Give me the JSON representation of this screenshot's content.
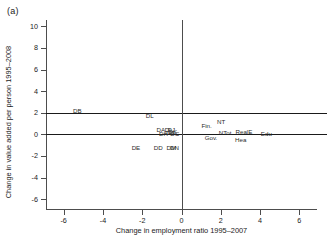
{
  "figure": {
    "panel_label": "(a)",
    "background": "#ffffff",
    "text_color": "#1a1a1a",
    "axis_color": "#4d4d4d",
    "refline_color": "#1a1a1a"
  },
  "chart_data": {
    "type": "scatter",
    "title": "",
    "panel": "(a)",
    "xlabel": "Change in employment ratio 1995–2007",
    "ylabel": "Change in value added per person 1995–2008",
    "xlim": [
      -6.9,
      6.9
    ],
    "ylim": [
      -6.9,
      10.6
    ],
    "xticks": [
      -6,
      -4,
      -2,
      0,
      2,
      4,
      6
    ],
    "xticklabels": [
      "-6",
      "-4",
      "-2",
      "0",
      "2",
      "4",
      "6"
    ],
    "yticks": [
      -6,
      -4,
      -2,
      0,
      2,
      4,
      6,
      8,
      10
    ],
    "yticklabels": [
      "-6",
      "-4",
      "-2",
      "0",
      "2",
      "4",
      "6",
      "8",
      "10"
    ],
    "grid": false,
    "legend": null,
    "marker_style": "text-label-only",
    "reference_lines": [
      {
        "orientation": "horizontal",
        "value": 2,
        "color": "#1a1a1a"
      },
      {
        "orientation": "horizontal",
        "value": 0,
        "color": "#1a1a1a"
      },
      {
        "orientation": "vertical",
        "value": 0,
        "color": "#4d4d4d"
      }
    ],
    "points": [
      {
        "label": "DB",
        "x": -5.3,
        "y": 2.15
      },
      {
        "label": "DL",
        "x": -1.62,
        "y": 1.72
      },
      {
        "label": "DA",
        "x": -1.05,
        "y": 0.38
      },
      {
        "label": "DH",
        "x": -0.92,
        "y": 0.04
      },
      {
        "label": "DI",
        "x": -0.7,
        "y": 0.4
      },
      {
        "label": "DJ",
        "x": -0.52,
        "y": 0.42
      },
      {
        "label": "DG",
        "x": -0.6,
        "y": 0.16
      },
      {
        "label": "DK",
        "x": -0.44,
        "y": 0.2
      },
      {
        "label": "DC",
        "x": -0.34,
        "y": 0.06
      },
      {
        "label": "DE",
        "x": -2.32,
        "y": -1.22
      },
      {
        "label": "DD",
        "x": -1.18,
        "y": -1.24
      },
      {
        "label": "DM",
        "x": -0.52,
        "y": -1.24
      },
      {
        "label": "DN",
        "x": -0.36,
        "y": -1.26
      },
      {
        "label": "Fin.",
        "x": 1.28,
        "y": 0.82
      },
      {
        "label": "NT",
        "x": 2.02,
        "y": 1.18
      },
      {
        "label": "NTot",
        "x": 2.22,
        "y": 0.1
      },
      {
        "label": "Gov.",
        "x": 1.5,
        "y": -0.3
      },
      {
        "label": "RealE",
        "x": 3.18,
        "y": 0.22
      },
      {
        "label": "Hea",
        "x": 3.02,
        "y": -0.52
      },
      {
        "label": "Edu",
        "x": 4.32,
        "y": 0.08
      }
    ]
  }
}
